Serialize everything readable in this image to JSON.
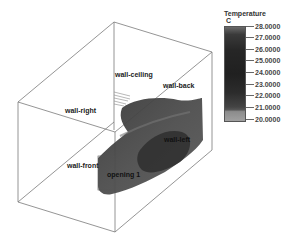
{
  "legend": {
    "title": "Temperature",
    "unit": "C",
    "ticks": [
      "28.0000",
      "27.0000",
      "26.0000",
      "25.0000",
      "24.0000",
      "23.0000",
      "22.0000",
      "21.0000",
      "20.0000"
    ]
  },
  "labels": {
    "wall_ceiling": "wall-ceiling",
    "wall_back": "wall-back",
    "wall_right": "wall-right",
    "wall_left": "wall-left",
    "wall_front": "wall-front",
    "opening": "opening 1"
  }
}
